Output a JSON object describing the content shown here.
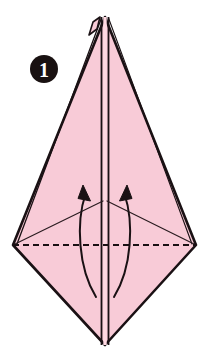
{
  "figure": {
    "kind": "origami-diagram",
    "background_color": "#ffffff"
  },
  "step_badge": {
    "name": "step-number-badge",
    "label": "1",
    "circle_color": "#191111",
    "text_color": "#ffffff",
    "cx": 44,
    "cy": 69,
    "r": 14
  },
  "palette": {
    "paper_fill": "#f8cbd7",
    "paper_fill_shadow": "#f2bfcd",
    "outline": "#1a1114",
    "crease_line": "#2a1c20",
    "arrow": "#1a1114",
    "highlight_gap": "#ffd9e2"
  },
  "shape": {
    "name": "kite-diamond-paper",
    "top_apex": {
      "x": 105,
      "y": 17
    },
    "left_corner": {
      "x": 13,
      "y": 245
    },
    "right_corner": {
      "x": 196,
      "y": 245
    },
    "bottom_apex": {
      "x": 105,
      "y": 345
    },
    "outline_width": 2.6,
    "description": "Pink kite-shaped folded paper with vertical center seam"
  },
  "center_seam": {
    "name": "center-vertical-seam",
    "x_left": 101.5,
    "x_right": 108.5,
    "y_top": 17,
    "y_bottom": 345,
    "stroke_width": 1.8
  },
  "top_layers": {
    "name": "apex-layer-slivers",
    "left_sliver": "narrow offset layer on upper-left of apex",
    "right_sliver": "narrow offset layer on upper-right of apex"
  },
  "crease_fold_line": {
    "name": "horizontal-valley-crease",
    "style": "dashed",
    "y": 245,
    "x_start": 13,
    "x_end": 196,
    "dash_length": 6,
    "dash_gap": 4,
    "stroke_width": 2
  },
  "diagonal_creases": [
    {
      "name": "left-diagonal-crease",
      "from": {
        "x": 13,
        "y": 245
      },
      "to": {
        "x": 103,
        "y": 201
      },
      "stroke_width": 1.2
    },
    {
      "name": "right-diagonal-crease",
      "from": {
        "x": 196,
        "y": 245
      },
      "to": {
        "x": 107,
        "y": 201
      },
      "stroke_width": 1.2
    }
  ],
  "arrows": [
    {
      "name": "left-fold-arrow",
      "direction": "up",
      "tail": {
        "x": 96,
        "y": 297
      },
      "head": {
        "x": 84,
        "y": 187
      },
      "curve_bulge": "left",
      "stroke_width": 2,
      "head_size": 9
    },
    {
      "name": "right-fold-arrow",
      "direction": "up",
      "tail": {
        "x": 114,
        "y": 297
      },
      "head": {
        "x": 126,
        "y": 187
      },
      "curve_bulge": "right",
      "stroke_width": 2,
      "head_size": 9
    }
  ]
}
